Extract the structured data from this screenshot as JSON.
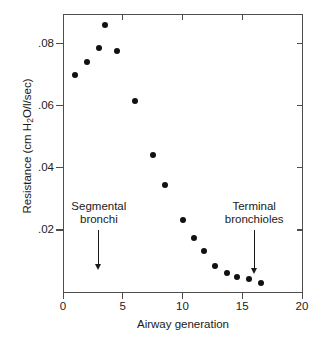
{
  "chart_data": {
    "type": "scatter",
    "title": "",
    "xlabel": "Airway generation",
    "ylabel": "Resistance (cm H2O/l/sec)",
    "ylabel_parts": {
      "pre": "Resistance (cm H",
      "sub": "2",
      "post": "O/l/sec)"
    },
    "xlim": [
      0,
      20
    ],
    "ylim": [
      0,
      0.0895
    ],
    "xticks": [
      0,
      5,
      10,
      15,
      20
    ],
    "xtick_labels": [
      "0",
      "5",
      "10",
      "15",
      "20"
    ],
    "yticks": [
      0.02,
      0.04,
      0.06,
      0.08
    ],
    "ytick_labels": [
      ".02",
      ".04",
      ".06",
      ".08"
    ],
    "grid": false,
    "legend": false,
    "marker": "filled-circle",
    "marker_color": "#111111",
    "axis_color": "#4d4d4d",
    "x": [
      1,
      2,
      3,
      3.5,
      4.5,
      6,
      7.5,
      8.5,
      10,
      11,
      11.8,
      12.7,
      13.7,
      14.6,
      15.6,
      16.6
    ],
    "y": [
      0.07,
      0.074,
      0.0785,
      0.086,
      0.0775,
      0.0615,
      0.044,
      0.0345,
      0.0232,
      0.0175,
      0.0132,
      0.0085,
      0.006,
      0.0048,
      0.0042,
      0.003
    ],
    "points": [
      {
        "x": 1,
        "y": 0.07
      },
      {
        "x": 2,
        "y": 0.074
      },
      {
        "x": 3,
        "y": 0.0785
      },
      {
        "x": 3.5,
        "y": 0.086
      },
      {
        "x": 4.5,
        "y": 0.0775
      },
      {
        "x": 6,
        "y": 0.0615
      },
      {
        "x": 7.5,
        "y": 0.044
      },
      {
        "x": 8.5,
        "y": 0.0345
      },
      {
        "x": 10,
        "y": 0.0232
      },
      {
        "x": 11,
        "y": 0.0175
      },
      {
        "x": 11.8,
        "y": 0.0132
      },
      {
        "x": 12.7,
        "y": 0.0085
      },
      {
        "x": 13.7,
        "y": 0.006
      },
      {
        "x": 14.6,
        "y": 0.0048
      },
      {
        "x": 15.6,
        "y": 0.0042
      },
      {
        "x": 16.6,
        "y": 0.003
      }
    ],
    "annotations": [
      {
        "id": "segmental-bronchi",
        "line1": "Segmental",
        "line2": "bronchi",
        "arrow_x": 3,
        "arrow_from_y": 0.02,
        "arrow_to_y": 0.0075
      },
      {
        "id": "terminal-bronchioles",
        "line1": "Terminal",
        "line2": "bronchioles",
        "arrow_x": 16,
        "arrow_from_y": 0.02,
        "arrow_to_y": 0.0062
      }
    ]
  }
}
